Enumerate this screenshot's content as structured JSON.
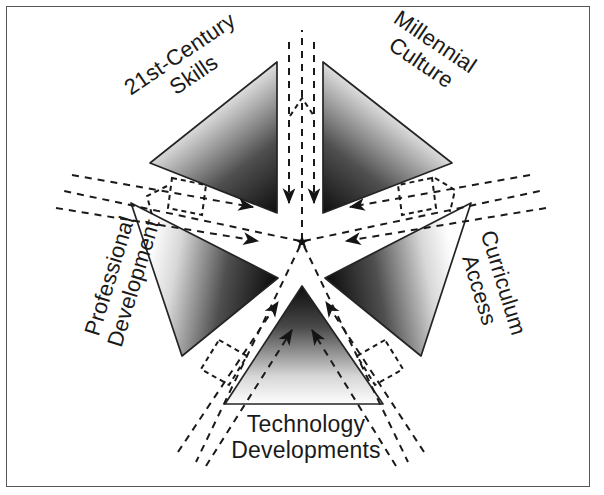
{
  "figure": {
    "kind": "radial-pinwheel-diagram",
    "center_marker": "star-asterisk",
    "border_color": "#54575c",
    "background_color": "#ffffff"
  },
  "nodes": [
    {
      "id": "skills",
      "label": "21st-Century\nSkills",
      "position": "upper-left",
      "rotation_deg": -34,
      "triangle_fill": "gradient-white-to-black",
      "apex_color": "#111111",
      "base_color": "#fdfdfd"
    },
    {
      "id": "millennial",
      "label": "Millennial\nCulture",
      "position": "upper-right",
      "rotation_deg": 34,
      "triangle_fill": "gradient-white-to-black",
      "apex_color": "#111111",
      "base_color": "#fdfdfd"
    },
    {
      "id": "curriculum",
      "label": "Curriculum\nAccess",
      "position": "right",
      "rotation_deg": 73,
      "triangle_fill": "gradient-white-to-black",
      "apex_color": "#111111",
      "base_color": "#fdfdfd"
    },
    {
      "id": "technology",
      "label": "Technology\nDevelopments",
      "position": "bottom",
      "rotation_deg": 0,
      "triangle_fill": "gradient-white-to-black",
      "apex_color": "#111111",
      "base_color": "#fdfdfd"
    },
    {
      "id": "professional",
      "label": "Professional\nDevelopment",
      "position": "left",
      "rotation_deg": -73,
      "triangle_fill": "gradient-white-to-black",
      "apex_color": "#111111",
      "base_color": "#fdfdfd"
    }
  ],
  "flows": {
    "description": "dashed inward arrows in each white channel between triangles",
    "channel_count": 5,
    "arrows_per_channel": 2,
    "direction": "inward-to-center",
    "line_style": "dashed",
    "line_color": "#1a1a1a"
  }
}
